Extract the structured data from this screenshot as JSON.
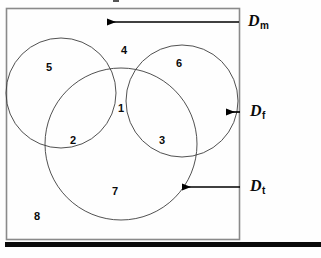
{
  "figure": {
    "type": "venn-diagram",
    "sets": 3,
    "universe_label": "8",
    "frame": {
      "stroke": "#8a8a8a",
      "fill": "#fefefe"
    },
    "circle_stroke": "#3a3a3a",
    "arrow_color": "#000000",
    "rule_color": "#000000"
  },
  "regions": [
    {
      "id": "r1",
      "label": "1",
      "meaning": "Dm and Df and Dt"
    },
    {
      "id": "r2",
      "label": "2",
      "meaning": "Dm and Dt only"
    },
    {
      "id": "r3",
      "label": "3",
      "meaning": "Df and Dt only"
    },
    {
      "id": "r4",
      "label": "4",
      "meaning": "Dm and Df only"
    },
    {
      "id": "r5",
      "label": "5",
      "meaning": "Dm only"
    },
    {
      "id": "r6",
      "label": "6",
      "meaning": "Df only"
    },
    {
      "id": "r7",
      "label": "7",
      "meaning": "Dt only"
    },
    {
      "id": "r8",
      "label": "8",
      "meaning": "outside all sets"
    }
  ],
  "set_labels": [
    {
      "id": "dm",
      "base": "D",
      "sub": "m",
      "arrow": "long"
    },
    {
      "id": "df",
      "base": "D",
      "sub": "f",
      "arrow": "short"
    },
    {
      "id": "dt",
      "base": "D",
      "sub": "t",
      "arrow": "medium"
    }
  ]
}
